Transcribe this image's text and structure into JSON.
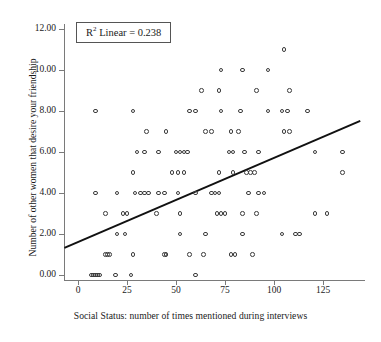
{
  "chart_data": {
    "type": "scatter",
    "title": "",
    "xlabel": "Social Status: number of times mentioned during interviews",
    "ylabel": "Number of other women that desire your friendship",
    "xlim": [
      -8,
      146
    ],
    "ylim": [
      -0.6,
      12.4
    ],
    "xticks": [
      0,
      25,
      50,
      75,
      100,
      125
    ],
    "xticklabels": [
      "0",
      "25",
      "50",
      "75",
      "100",
      "125"
    ],
    "yticks": [
      0,
      2,
      4,
      6,
      8,
      10,
      12
    ],
    "yticklabels": [
      "0.00",
      "2.00",
      "4.00",
      "6.00",
      "8.00",
      "10.00",
      "12.00"
    ],
    "grid": false,
    "legend": null,
    "annotation": {
      "text": "R2 Linear = 0.238",
      "r_squared": 0.238,
      "prefix": "R",
      "superscript": "2",
      "suffix": " Linear = 0.238"
    },
    "fit_line": {
      "type": "linear",
      "x_start": -7,
      "y_start": 1.35,
      "x_end": 144,
      "y_end": 7.55,
      "slope": 0.041,
      "intercept": 1.64,
      "color": "#111111"
    },
    "marker": {
      "shape": "open-circle",
      "edge_color": "#3b3b3b",
      "fill": "none",
      "size": 4.6
    },
    "points": [
      [
        7,
        0
      ],
      [
        8,
        0
      ],
      [
        9,
        0
      ],
      [
        10,
        0
      ],
      [
        11,
        0
      ],
      [
        19,
        0
      ],
      [
        27,
        0
      ],
      [
        60,
        0
      ],
      [
        14,
        1
      ],
      [
        15,
        1
      ],
      [
        16,
        1
      ],
      [
        28,
        1
      ],
      [
        44,
        1
      ],
      [
        45,
        1
      ],
      [
        57,
        1
      ],
      [
        64,
        1
      ],
      [
        78,
        1
      ],
      [
        80,
        1
      ],
      [
        89,
        1
      ],
      [
        20,
        2
      ],
      [
        24,
        2
      ],
      [
        52,
        2
      ],
      [
        65,
        2
      ],
      [
        84,
        2
      ],
      [
        104,
        2
      ],
      [
        111,
        2
      ],
      [
        113,
        2
      ],
      [
        14,
        3
      ],
      [
        23,
        3
      ],
      [
        25,
        3
      ],
      [
        40,
        3
      ],
      [
        52,
        3
      ],
      [
        71,
        3
      ],
      [
        73,
        3
      ],
      [
        75,
        3
      ],
      [
        84,
        3
      ],
      [
        91,
        3
      ],
      [
        121,
        3
      ],
      [
        127,
        3
      ],
      [
        9,
        4
      ],
      [
        20,
        4
      ],
      [
        29,
        4
      ],
      [
        32,
        4
      ],
      [
        34,
        4
      ],
      [
        36,
        4
      ],
      [
        41,
        4
      ],
      [
        44,
        4
      ],
      [
        51,
        4
      ],
      [
        60,
        4
      ],
      [
        68,
        4
      ],
      [
        70,
        4
      ],
      [
        72,
        4
      ],
      [
        87,
        4
      ],
      [
        92,
        4
      ],
      [
        95,
        4
      ],
      [
        28,
        5
      ],
      [
        48,
        5
      ],
      [
        51,
        5
      ],
      [
        54,
        5
      ],
      [
        72,
        5
      ],
      [
        79,
        5
      ],
      [
        86,
        5
      ],
      [
        88,
        5
      ],
      [
        90,
        5
      ],
      [
        135,
        5
      ],
      [
        30,
        6
      ],
      [
        34,
        6
      ],
      [
        41,
        6
      ],
      [
        50,
        6
      ],
      [
        52,
        6
      ],
      [
        54,
        6
      ],
      [
        56,
        6
      ],
      [
        77,
        6
      ],
      [
        79,
        6
      ],
      [
        85,
        6
      ],
      [
        92,
        6
      ],
      [
        121,
        6
      ],
      [
        135,
        6
      ],
      [
        35,
        7
      ],
      [
        45,
        7
      ],
      [
        65,
        7
      ],
      [
        68,
        7
      ],
      [
        78,
        7
      ],
      [
        82,
        7
      ],
      [
        105,
        7
      ],
      [
        108,
        7
      ],
      [
        9,
        8
      ],
      [
        28,
        8
      ],
      [
        57,
        8
      ],
      [
        60,
        8
      ],
      [
        73,
        8
      ],
      [
        83,
        8
      ],
      [
        97,
        8
      ],
      [
        104,
        8
      ],
      [
        107,
        8
      ],
      [
        117,
        8
      ],
      [
        63,
        9
      ],
      [
        72,
        9
      ],
      [
        91,
        9
      ],
      [
        108,
        9
      ],
      [
        73,
        10
      ],
      [
        84,
        10
      ],
      [
        97,
        10
      ],
      [
        105,
        11
      ]
    ]
  },
  "axis": {
    "x_title": "Social Status: number of times mentioned during interviews",
    "y_title": "Number of other women that desire your friendship"
  }
}
